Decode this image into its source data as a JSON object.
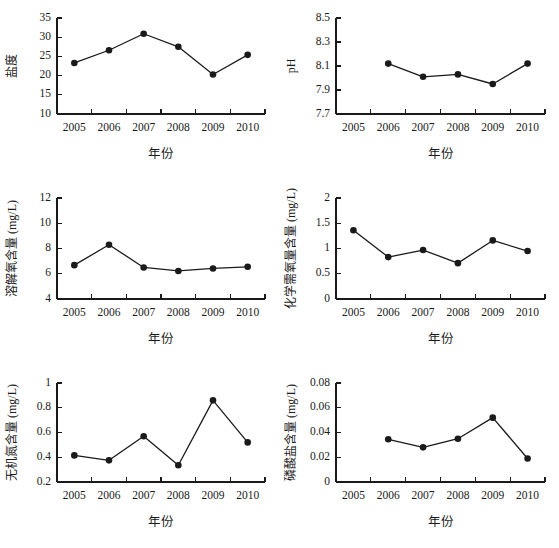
{
  "figure": {
    "background_color": "#ffffff",
    "ink_color": "#1a1a1a",
    "layout": "2 columns x 3 rows of line charts"
  },
  "common": {
    "xlabel": "年份",
    "year_ticks": [
      "2005",
      "2006",
      "2007",
      "2008",
      "2009",
      "2010"
    ]
  },
  "chart_data": [
    {
      "id": "salinity",
      "type": "line",
      "title": "",
      "ylabel": "盐度",
      "xlabel": "年份",
      "categories": [
        "2005",
        "2006",
        "2007",
        "2008",
        "2009",
        "2010"
      ],
      "x": [
        2005,
        2006,
        2007,
        2008,
        2009,
        2010
      ],
      "values": [
        23.3,
        26.6,
        30.9,
        27.5,
        20.3,
        25.4
      ],
      "ylim": [
        10,
        35
      ],
      "yticks": [
        10,
        15,
        20,
        25,
        30,
        35
      ],
      "ytick_labels": [
        "10",
        "15",
        "20",
        "25",
        "30",
        "35"
      ],
      "xtick_labels": [
        "2005",
        "2006",
        "2007",
        "2008",
        "2009",
        "2010"
      ],
      "grid": false,
      "legend": false,
      "marker": "filled-circle"
    },
    {
      "id": "ph",
      "type": "line",
      "title": "",
      "ylabel": "pH",
      "xlabel": "年份",
      "categories": [
        "2005",
        "2006",
        "2007",
        "2008",
        "2009",
        "2010"
      ],
      "x": [
        2006,
        2007,
        2008,
        2009,
        2010
      ],
      "values": [
        8.12,
        8.01,
        8.03,
        7.95,
        8.12
      ],
      "ylim": [
        7.7,
        8.5
      ],
      "yticks": [
        7.7,
        7.9,
        8.1,
        8.3,
        8.5
      ],
      "ytick_labels": [
        "7.7",
        "7.9",
        "8.1",
        "8.3",
        "8.5"
      ],
      "xtick_labels": [
        "2005",
        "2006",
        "2007",
        "2008",
        "2009",
        "2010"
      ],
      "grid": false,
      "legend": false,
      "marker": "filled-circle"
    },
    {
      "id": "dissolved-oxygen",
      "type": "line",
      "title": "",
      "ylabel": "溶解氧含量 (mg/L)",
      "xlabel": "年份",
      "categories": [
        "2005",
        "2006",
        "2007",
        "2008",
        "2009",
        "2010"
      ],
      "x": [
        2005,
        2006,
        2007,
        2008,
        2009,
        2010
      ],
      "values": [
        6.68,
        8.3,
        6.5,
        6.22,
        6.42,
        6.55
      ],
      "ylim": [
        4,
        12
      ],
      "yticks": [
        4,
        6,
        8,
        10,
        12
      ],
      "ytick_labels": [
        "4",
        "6",
        "8",
        "10",
        "12"
      ],
      "xtick_labels": [
        "2005",
        "2006",
        "2007",
        "2008",
        "2009",
        "2010"
      ],
      "grid": false,
      "legend": false,
      "marker": "filled-circle"
    },
    {
      "id": "chemical-oxygen-demand",
      "type": "line",
      "title": "",
      "ylabel": "化学需氧量含量 (mg/L)",
      "xlabel": "年份",
      "categories": [
        "2005",
        "2006",
        "2007",
        "2008",
        "2009",
        "2010"
      ],
      "x": [
        2005,
        2006,
        2007,
        2008,
        2009,
        2010
      ],
      "values": [
        1.36,
        0.83,
        0.97,
        0.71,
        1.16,
        0.95
      ],
      "ylim": [
        0,
        2
      ],
      "yticks": [
        0,
        0.5,
        1,
        1.5,
        2
      ],
      "ytick_labels": [
        "0",
        "0.5",
        "1",
        "1.5",
        "2"
      ],
      "xtick_labels": [
        "2005",
        "2006",
        "2007",
        "2008",
        "2009",
        "2010"
      ],
      "grid": false,
      "legend": false,
      "marker": "filled-circle"
    },
    {
      "id": "inorganic-nitrogen",
      "type": "line",
      "title": "",
      "ylabel": "无机氮含量 (mg/L)",
      "xlabel": "年份",
      "categories": [
        "2005",
        "2006",
        "2007",
        "2008",
        "2009",
        "2010"
      ],
      "x": [
        2005,
        2006,
        2007,
        2008,
        2009,
        2010
      ],
      "values": [
        0.415,
        0.375,
        0.57,
        0.335,
        0.86,
        0.52
      ],
      "ylim": [
        0.2,
        1
      ],
      "yticks": [
        0.2,
        0.4,
        0.6,
        0.8,
        1
      ],
      "ytick_labels": [
        "0.2",
        "0.4",
        "0.6",
        "0.8",
        "1"
      ],
      "xtick_labels": [
        "2005",
        "2006",
        "2007",
        "2008",
        "2009",
        "2010"
      ],
      "grid": false,
      "legend": false,
      "marker": "filled-circle"
    },
    {
      "id": "phosphate",
      "type": "line",
      "title": "",
      "ylabel": "磷酸盐含量 (mg/L)",
      "xlabel": "年份",
      "categories": [
        "2005",
        "2006",
        "2007",
        "2008",
        "2009",
        "2010"
      ],
      "x": [
        2006,
        2007,
        2008,
        2009,
        2010
      ],
      "values": [
        0.0345,
        0.028,
        0.035,
        0.052,
        0.019
      ],
      "ylim": [
        0,
        0.08
      ],
      "yticks": [
        0,
        0.02,
        0.04,
        0.06,
        0.08
      ],
      "ytick_labels": [
        "0",
        "0.02",
        "0.04",
        "0.06",
        "0.08"
      ],
      "xtick_labels": [
        "2005",
        "2006",
        "2007",
        "2008",
        "2009",
        "2010"
      ],
      "grid": false,
      "legend": false,
      "marker": "filled-circle"
    }
  ]
}
